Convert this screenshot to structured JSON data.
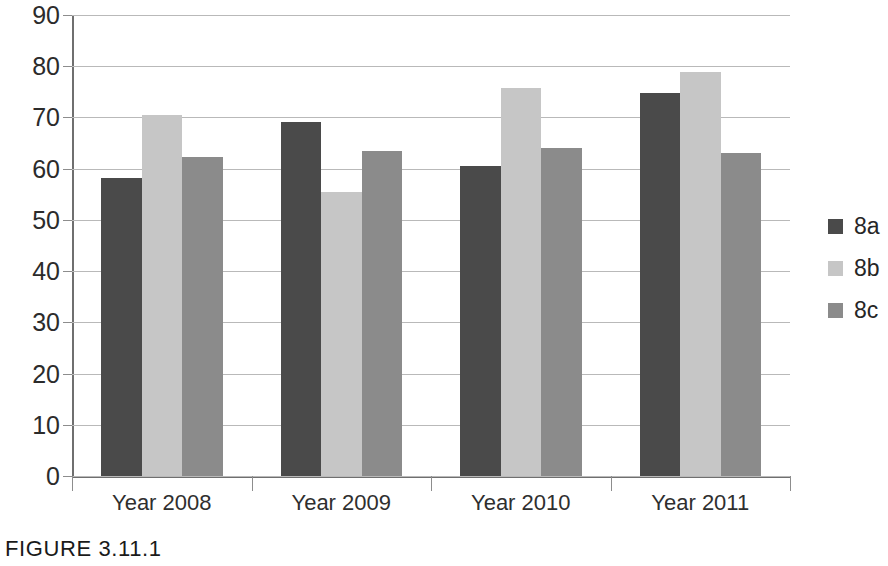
{
  "caption": "FIGURE 3.11.1",
  "chart_data": {
    "type": "bar",
    "title": "",
    "xlabel": "",
    "ylabel": "",
    "ylim": [
      0,
      90
    ],
    "yticks": [
      0,
      10,
      20,
      30,
      40,
      50,
      60,
      70,
      80,
      90
    ],
    "ytick_labels": [
      "0",
      "10",
      "20",
      "30",
      "40",
      "50",
      "60",
      "70",
      "80",
      "90"
    ],
    "grid": true,
    "legend_position": "right",
    "categories": [
      "Year 2008",
      "Year 2009",
      "Year 2010",
      "Year 2011"
    ],
    "series": [
      {
        "name": "8a",
        "color": "#4a4a4a",
        "values": [
          58.2,
          69.2,
          60.6,
          74.8
        ]
      },
      {
        "name": "8b",
        "color": "#c6c6c6",
        "values": [
          70.4,
          55.4,
          75.7,
          78.9
        ]
      },
      {
        "name": "8c",
        "color": "#8b8b8b",
        "values": [
          62.3,
          63.5,
          64.0,
          63.1
        ]
      }
    ]
  },
  "legend": {
    "items": [
      {
        "label": "8a",
        "color": "#4a4a4a"
      },
      {
        "label": "8b",
        "color": "#c6c6c6"
      },
      {
        "label": "8c",
        "color": "#8b8b8b"
      }
    ]
  }
}
